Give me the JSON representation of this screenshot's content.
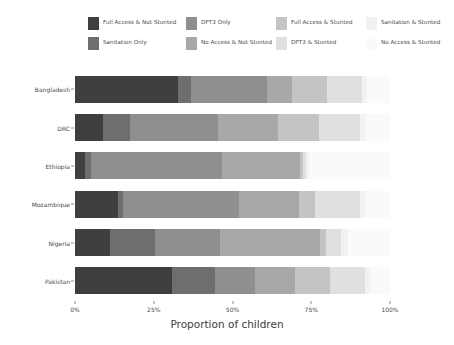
{
  "chart_data": {
    "type": "bar",
    "orientation": "horizontal",
    "stacked": true,
    "normalized": true,
    "title": "",
    "xlabel": "Proportion of children",
    "ylabel": "",
    "xlim": [
      0,
      100
    ],
    "xticks": [
      0,
      25,
      50,
      75,
      100
    ],
    "xticklabels": [
      "0%",
      "25%",
      "50%",
      "75%",
      "100%"
    ],
    "grid": false,
    "legend_position": "top",
    "categories": [
      "Bangladesh",
      "DRC",
      "Ethiopia",
      "Mozambique",
      "Nigeria",
      "Pakistan"
    ],
    "series": [
      {
        "name": "Full Access & Not Stunted",
        "color": "#3f3f3f",
        "values": [
          32.7,
          9.0,
          3.2,
          13.7,
          11.2,
          30.8
        ]
      },
      {
        "name": "Sanitation Only",
        "color": "#6e6e6e",
        "values": [
          4.0,
          8.5,
          2.0,
          1.5,
          14.3,
          13.6
        ]
      },
      {
        "name": "DPT3 Only",
        "color": "#8f8f8f",
        "values": [
          24.2,
          28.0,
          41.5,
          37.0,
          20.6,
          12.7
        ]
      },
      {
        "name": "No Access & Not Stunted",
        "color": "#a8a8a8",
        "values": [
          8.0,
          19.0,
          24.8,
          19.0,
          31.7,
          12.7
        ]
      },
      {
        "name": "Full Access & Stunted",
        "color": "#c4c4c4",
        "values": [
          11.1,
          13.0,
          0.9,
          5.1,
          2.0,
          11.1
        ]
      },
      {
        "name": "DPT3 & Stunted",
        "color": "#e0e0e0",
        "values": [
          11.1,
          13.0,
          0.9,
          14.3,
          4.8,
          11.1
        ]
      },
      {
        "name": "Sanitation & Stunted",
        "color": "#f2f2f2",
        "values": [
          1.6,
          2.0,
          0.9,
          1.6,
          2.0,
          1.6
        ]
      },
      {
        "name": "No Access & Stunted",
        "color": "#fafafa",
        "values": [
          7.3,
          7.5,
          25.8,
          7.8,
          13.4,
          6.4
        ]
      }
    ],
    "legend_entries": [
      {
        "label": "Full Access & Not Stunted",
        "color": "#3f3f3f"
      },
      {
        "label": "Sanitation Only",
        "color": "#6e6e6e"
      },
      {
        "label": "DPT3 Only",
        "color": "#8f8f8f"
      },
      {
        "label": "No Access & Not Stunted",
        "color": "#a8a8a8"
      },
      {
        "label": "Full Access & Stunted",
        "color": "#c4c4c4"
      },
      {
        "label": "DPT3 & Stunted",
        "color": "#e0e0e0"
      },
      {
        "label": "Sanitation & Stunted",
        "color": "#f2f2f2"
      },
      {
        "label": "No Access & Stunted",
        "color": "#fafafa"
      }
    ]
  }
}
